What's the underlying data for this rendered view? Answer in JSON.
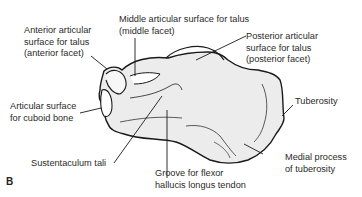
{
  "figure": {
    "panel_label": "B",
    "colors": {
      "bone_fill": "#ececec",
      "outline": "#1a1a1a",
      "leader": "#1a1a1a",
      "text": "#2a2a2a"
    }
  },
  "labels": {
    "anterior_facet": [
      "Anterior articular",
      "surface for talus",
      "(anterior facet)"
    ],
    "middle_facet": [
      "Middle articular surface for talus",
      "(middle facet)"
    ],
    "posterior_facet": [
      "Posterior articular",
      "surface for talus",
      "(posterior facet)"
    ],
    "cuboid": [
      "Articular surface",
      "for cuboid bone"
    ],
    "tuberosity": [
      "Tuberosity"
    ],
    "sustentaculum": [
      "Sustentaculum tali"
    ],
    "groove": [
      "Groove for flexor",
      "hallucis longus tendon"
    ],
    "medial_process": [
      "Medial process",
      "of tuberosity"
    ]
  }
}
